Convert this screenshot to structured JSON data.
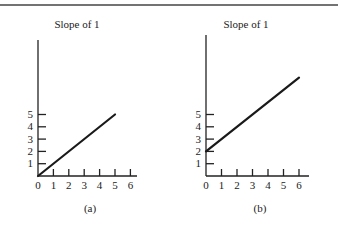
{
  "figure": {
    "top_rule": true
  },
  "chart_data": [
    {
      "type": "line",
      "panel_label": "(a)",
      "title": "Slope of 1",
      "xlabel": "",
      "ylabel": "",
      "x_ticks": [
        0,
        1,
        2,
        3,
        4,
        5,
        6
      ],
      "y_ticks": [
        1,
        2,
        3,
        4,
        5
      ],
      "xlim": [
        0,
        6.3
      ],
      "ylim": [
        0,
        11
      ],
      "grid": false,
      "series": [
        {
          "name": "line",
          "x": [
            0,
            5
          ],
          "y": [
            0,
            5
          ]
        }
      ]
    },
    {
      "type": "line",
      "panel_label": "(b)",
      "title": "Slope of 1",
      "xlabel": "",
      "ylabel": "",
      "x_ticks": [
        0,
        1,
        2,
        3,
        4,
        5,
        6
      ],
      "y_ticks": [
        1,
        2,
        3,
        4,
        5
      ],
      "xlim": [
        0,
        6.6
      ],
      "ylim": [
        0,
        11.5
      ],
      "grid": false,
      "series": [
        {
          "name": "line",
          "x": [
            0,
            6
          ],
          "y": [
            2,
            8
          ]
        }
      ]
    }
  ],
  "layout": {
    "panels": [
      {
        "ox": 38,
        "oy": 176,
        "xunit": 15.4,
        "yunit": 12.3,
        "axis_top": 40,
        "axis_right": 137,
        "title_x": 77,
        "label_x": 90
      },
      {
        "ox": 206,
        "oy": 176,
        "xunit": 15.5,
        "yunit": 12.3,
        "axis_top": 35,
        "axis_right": 309,
        "title_x": 246,
        "label_x": 260
      }
    ],
    "title_y": 28,
    "label_y": 212
  }
}
